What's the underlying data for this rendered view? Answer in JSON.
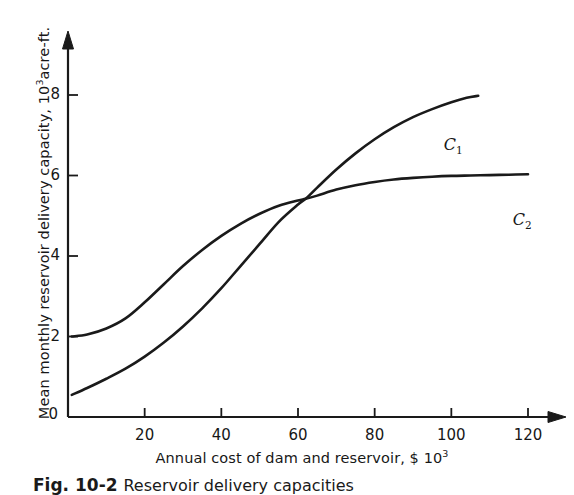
{
  "chart_data": {
    "type": "line",
    "title": "",
    "xlabel": "Annual cost of dam and reservoir, $ 10",
    "xlabel_exponent": "3",
    "ylabel": "Mean monthly reservoir delivery capacity, 10",
    "ylabel_exponent": "3",
    "ylabel_tail": "acre-ft.",
    "xlim": [
      0,
      125
    ],
    "ylim": [
      0,
      9
    ],
    "xticks": [
      20,
      40,
      60,
      80,
      100,
      120
    ],
    "xtick_labels": [
      "20",
      "40",
      "60",
      "80",
      "100",
      "120"
    ],
    "yticks": [
      2,
      4,
      6,
      8
    ],
    "ytick_labels": [
      "2",
      "4",
      "6",
      "8"
    ],
    "origin_label": "0",
    "grid": false,
    "legend_position": "inline-annotation",
    "series": [
      {
        "name": "C1",
        "label": "C",
        "label_sub": "1",
        "color": "#1a1a1a",
        "x": [
          1,
          5,
          10,
          15,
          20,
          25,
          30,
          35,
          40,
          45,
          50,
          55,
          60,
          62,
          65,
          70,
          75,
          80,
          85,
          90,
          95,
          100,
          104,
          107
        ],
        "y": [
          0.55,
          0.72,
          0.95,
          1.2,
          1.5,
          1.85,
          2.25,
          2.7,
          3.2,
          3.75,
          4.3,
          4.85,
          5.28,
          5.42,
          5.7,
          6.15,
          6.55,
          6.9,
          7.2,
          7.45,
          7.65,
          7.82,
          7.93,
          7.98
        ]
      },
      {
        "name": "C2",
        "label": "C",
        "label_sub": "2",
        "color": "#1a1a1a",
        "x": [
          1,
          5,
          10,
          15,
          20,
          25,
          30,
          35,
          40,
          45,
          50,
          55,
          60,
          62,
          65,
          70,
          75,
          80,
          85,
          90,
          95,
          100,
          105,
          110,
          115,
          120
        ],
        "y": [
          2.0,
          2.05,
          2.2,
          2.45,
          2.85,
          3.3,
          3.75,
          4.15,
          4.5,
          4.8,
          5.05,
          5.25,
          5.38,
          5.42,
          5.5,
          5.65,
          5.76,
          5.84,
          5.9,
          5.94,
          5.97,
          5.99,
          6.0,
          6.01,
          6.02,
          6.03
        ]
      }
    ],
    "annotations": [
      {
        "text": "C1",
        "x": 98,
        "y": 6.95
      },
      {
        "text": "C2",
        "x": 116,
        "y": 5.1
      }
    ]
  },
  "caption": {
    "figure_number": "Fig. 10-2",
    "text": "Reservoir delivery capacities"
  }
}
